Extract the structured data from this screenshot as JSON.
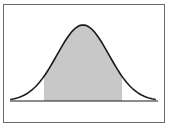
{
  "figure": {
    "type": "normal-distribution-curve",
    "shaded_region": {
      "from_sd": -1.5,
      "to_sd": 1.5
    },
    "colors": {
      "border": "#6a6a6a",
      "curve": "#1a1a1a",
      "baseline": "#1a1a1a",
      "shade": "#c8c8c8",
      "background": "#ffffff"
    }
  },
  "chart_data": {
    "type": "area",
    "title": "",
    "xlabel": "",
    "ylabel": "",
    "shaded_range_sd": [
      -1.5,
      1.5
    ],
    "x_range_sd": [
      -2.8,
      2.8
    ],
    "grid": false
  }
}
